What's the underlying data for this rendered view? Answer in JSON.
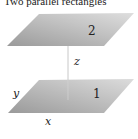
{
  "title": "Two parallel rectangles",
  "diagram": {
    "rectangles": [
      {
        "id": "2",
        "label": "2",
        "position": "upper"
      },
      {
        "id": "1",
        "label": "1",
        "position": "lower"
      }
    ],
    "axes": {
      "x_label": "x",
      "y_label": "y",
      "z_label": "z"
    },
    "colors": {
      "rect_fill_light": "#d8d8d8",
      "rect_fill_dark": "#9e9e9e",
      "axis_line": "#c8c8c8",
      "text": "#222222"
    }
  }
}
